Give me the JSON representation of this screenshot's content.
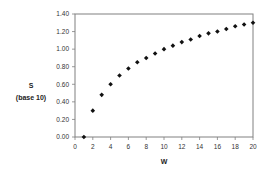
{
  "chart_data": {
    "type": "scatter",
    "title": "",
    "xlabel": "W",
    "ylabel": "S",
    "ylabel_sub": "(base 10)",
    "x": [
      1,
      2,
      3,
      4,
      5,
      6,
      7,
      8,
      9,
      10,
      11,
      12,
      13,
      14,
      15,
      16,
      17,
      18,
      19,
      20
    ],
    "values": [
      0.0,
      0.3,
      0.48,
      0.6,
      0.7,
      0.78,
      0.85,
      0.9,
      0.95,
      1.0,
      1.04,
      1.08,
      1.11,
      1.15,
      1.18,
      1.2,
      1.23,
      1.26,
      1.28,
      1.3
    ],
    "xlim": [
      0,
      20
    ],
    "ylim": [
      0,
      1.4
    ],
    "xticks": [
      0,
      2,
      4,
      6,
      8,
      10,
      12,
      14,
      16,
      18,
      20
    ],
    "yticks": [
      0.0,
      0.2,
      0.4,
      0.6,
      0.8,
      1.0,
      1.2,
      1.4
    ],
    "xtick_labels": [
      "0",
      "2",
      "4",
      "6",
      "8",
      "10",
      "12",
      "14",
      "16",
      "18",
      "20"
    ],
    "ytick_labels": [
      "0.00",
      "0.20",
      "0.40",
      "0.60",
      "0.80",
      "1.00",
      "1.20",
      "1.40"
    ],
    "grid": false,
    "legend": null,
    "marker": "diamond",
    "colors": {
      "marker": "#111111",
      "axis": "#808080",
      "text": "#333333"
    }
  }
}
